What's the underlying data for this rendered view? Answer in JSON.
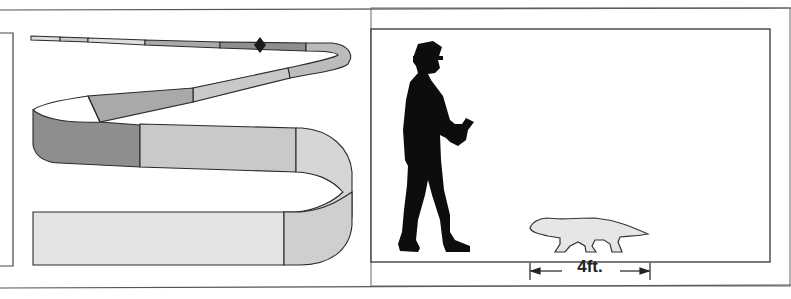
{
  "figure": {
    "left_panel": {
      "description": "ribbon-shaped range band with segmented shades",
      "marker": "diamond-marker",
      "band_colors": {
        "dark": "#8e8e8e",
        "medium": "#a9a9a9",
        "light": "#c9c9c9",
        "lightest": "#dedede",
        "outline": "#2a2a2a"
      }
    },
    "right_panel": {
      "description": "size comparison silhouette of a man and an animal",
      "figures": [
        "man-silhouette",
        "animal-silhouette"
      ],
      "scale_label": "4ft.",
      "colors": {
        "silhouette": "#0d0d0d",
        "animal_fill": "#e6e6e6",
        "frame": "#3a3a3a"
      }
    }
  }
}
